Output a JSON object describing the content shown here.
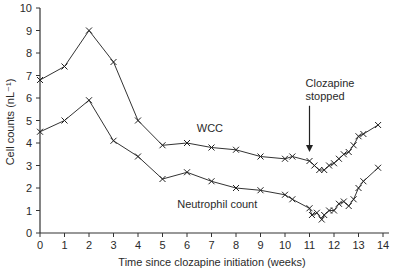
{
  "chart_data": {
    "type": "line",
    "title": "",
    "xlabel": "Time since clozapine initiation (weeks)",
    "ylabel": "Cell counts (nL⁻¹)",
    "xlim": [
      0,
      14
    ],
    "ylim": [
      0,
      10
    ],
    "xticks": [
      "0",
      "1",
      "2",
      "3",
      "4",
      "5",
      "6",
      "7",
      "8",
      "9",
      "10",
      "11",
      "12",
      "13",
      "14"
    ],
    "yticks": [
      "0",
      "1",
      "2",
      "3",
      "4",
      "5",
      "6",
      "7",
      "8",
      "9",
      "10"
    ],
    "grid": false,
    "legend": "none",
    "series": [
      {
        "name": "WCC",
        "marker": "x",
        "x": [
          0,
          1,
          2,
          3,
          4,
          5,
          6,
          7,
          8,
          9,
          10,
          10.3,
          11,
          11.2,
          11.4,
          11.6,
          11.8,
          12,
          12.2,
          12.4,
          12.6,
          12.8,
          13,
          13.2,
          13.8
        ],
        "values": [
          6.8,
          7.4,
          9.0,
          7.6,
          5.0,
          3.9,
          4.0,
          3.8,
          3.7,
          3.4,
          3.3,
          3.4,
          3.2,
          3.0,
          2.8,
          2.8,
          3.0,
          3.1,
          3.3,
          3.5,
          3.6,
          3.9,
          4.3,
          4.4,
          4.8
        ]
      },
      {
        "name": "Neutrophil count",
        "marker": "x",
        "x": [
          0,
          1,
          2,
          3,
          4,
          5,
          6,
          7,
          8,
          9,
          10,
          10.3,
          11,
          11.1,
          11.3,
          11.5,
          11.6,
          11.8,
          12,
          12.2,
          12.4,
          12.6,
          12.8,
          13,
          13.2,
          13.8
        ],
        "values": [
          4.5,
          5.0,
          5.9,
          4.1,
          3.4,
          2.4,
          2.7,
          2.3,
          2.0,
          1.9,
          1.7,
          1.5,
          1.1,
          0.8,
          0.9,
          0.6,
          0.8,
          1.0,
          1.0,
          1.3,
          1.4,
          1.2,
          1.5,
          2.0,
          2.3,
          2.9
        ]
      }
    ],
    "annotations": [
      {
        "text": "WCC",
        "x": 6.4,
        "y": 4.5
      },
      {
        "text": "Neutrophil count",
        "x": 5.6,
        "y": 1.1
      },
      {
        "text": "Clozapine\nstopped",
        "x": 11,
        "y": 6.5,
        "arrow_to": [
          11,
          3.6
        ]
      }
    ]
  }
}
